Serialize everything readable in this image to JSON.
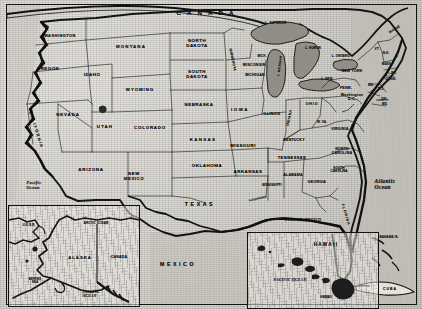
{
  "map": {
    "title": "United States of America political map with Alaska and Hawaii insets",
    "style": "vintage monochrome halftone scan",
    "colors": {
      "ink": "#121212",
      "paper": "#d8d6d0",
      "lake_fill": "#8d8a84",
      "ocean_texture": "#b9b6b0"
    },
    "countries": [
      {
        "name": "CANADA",
        "x": 208,
        "y": 13
      },
      {
        "name": "MEXICO",
        "x": 178,
        "y": 265
      },
      {
        "name": "CUBA",
        "x": 390,
        "y": 290
      }
    ],
    "states": [
      {
        "name": "WASHINGTON",
        "x": 60,
        "y": 36
      },
      {
        "name": "OREGON",
        "x": 48,
        "y": 69
      },
      {
        "name": "IDAHO",
        "x": 92,
        "y": 75
      },
      {
        "name": "MONTANA",
        "x": 131,
        "y": 47
      },
      {
        "name": "WYOMING",
        "x": 140,
        "y": 90
      },
      {
        "name": "NEVADA",
        "x": 68,
        "y": 115
      },
      {
        "name": "UTAH",
        "x": 105,
        "y": 127
      },
      {
        "name": "CALIFORNIA",
        "x": 36,
        "y": 130
      },
      {
        "name": "ARIZONA",
        "x": 91,
        "y": 170
      },
      {
        "name": "NEW\nMEXICO",
        "x": 134,
        "y": 177
      },
      {
        "name": "COLORADO",
        "x": 150,
        "y": 128
      },
      {
        "name": "NORTH\nDAKOTA",
        "x": 197,
        "y": 44
      },
      {
        "name": "SOUTH\nDAKOTA",
        "x": 197,
        "y": 75
      },
      {
        "name": "NEBRASKA",
        "x": 199,
        "y": 105
      },
      {
        "name": "KANSAS",
        "x": 203,
        "y": 140
      },
      {
        "name": "OKLAHOMA",
        "x": 207,
        "y": 166
      },
      {
        "name": "TEXAS",
        "x": 200,
        "y": 205
      },
      {
        "name": "MINNESOTA",
        "x": 232,
        "y": 60
      },
      {
        "name": "IOWA",
        "x": 240,
        "y": 110
      },
      {
        "name": "MISSOURI",
        "x": 243,
        "y": 146
      },
      {
        "name": "ARKANSAS",
        "x": 248,
        "y": 172
      },
      {
        "name": "LOUISIANA",
        "x": 258,
        "y": 199
      },
      {
        "name": "WISCONSIN",
        "x": 254,
        "y": 66
      },
      {
        "name": "MICH.",
        "x": 262,
        "y": 56
      },
      {
        "name": "MICHIGAN",
        "x": 255,
        "y": 76
      },
      {
        "name": "ILLINOIS",
        "x": 272,
        "y": 115
      },
      {
        "name": "INDIANA",
        "x": 290,
        "y": 118
      },
      {
        "name": "OHIO",
        "x": 312,
        "y": 105
      },
      {
        "name": "KENTUCKY",
        "x": 294,
        "y": 141
      },
      {
        "name": "TENNESSEE",
        "x": 292,
        "y": 158
      },
      {
        "name": "MISSISSIPPI",
        "x": 272,
        "y": 185
      },
      {
        "name": "ALABAMA",
        "x": 293,
        "y": 176
      },
      {
        "name": "GEORGIA",
        "x": 317,
        "y": 183
      },
      {
        "name": "FLORIDA",
        "x": 345,
        "y": 215
      },
      {
        "name": "W. VA.",
        "x": 322,
        "y": 122
      },
      {
        "name": "VIRGINIA",
        "x": 340,
        "y": 130
      },
      {
        "name": "NORTH\nCAROLINA",
        "x": 342,
        "y": 152
      },
      {
        "name": "SOUTH\nCAROLINA",
        "x": 339,
        "y": 170
      },
      {
        "name": "PENN.",
        "x": 346,
        "y": 89
      },
      {
        "name": "NEW YORK",
        "x": 352,
        "y": 72
      },
      {
        "name": "MAINE",
        "x": 395,
        "y": 30
      },
      {
        "name": "VT.",
        "x": 377,
        "y": 49
      },
      {
        "name": "N.H.",
        "x": 386,
        "y": 53
      },
      {
        "name": "MASS.",
        "x": 387,
        "y": 64
      },
      {
        "name": "R.I.",
        "x": 394,
        "y": 73
      },
      {
        "name": "CONN.",
        "x": 391,
        "y": 79
      },
      {
        "name": "N.J.",
        "x": 381,
        "y": 89
      },
      {
        "name": "MD.",
        "x": 371,
        "y": 85
      },
      {
        "name": "DEL.",
        "x": 385,
        "y": 99
      },
      {
        "name": "MD.",
        "x": 385,
        "y": 104
      }
    ],
    "cities": [
      {
        "name": "Washington\nD.C.",
        "x": 352,
        "y": 98
      }
    ],
    "lakes": [
      {
        "name": "L. SUPERIOR",
        "x": 276,
        "y": 23
      },
      {
        "name": "L. HURON",
        "x": 313,
        "y": 48
      },
      {
        "name": "L. ONTARIO",
        "x": 341,
        "y": 56
      },
      {
        "name": "L. ERIE",
        "x": 327,
        "y": 79
      },
      {
        "name": "L. MICHIGAN",
        "x": 280,
        "y": 66
      }
    ],
    "waters": [
      {
        "name": "Pacific\nOcean",
        "x": 34,
        "y": 186,
        "size": "o3"
      },
      {
        "name": "Atlantic\nOcean",
        "x": 385,
        "y": 184,
        "size": "o2"
      },
      {
        "name": "GULF OF MEXICO",
        "x": 303,
        "y": 221,
        "size": "o4"
      }
    ],
    "islands": [
      {
        "name": "BAHAMA IS.",
        "x": 389,
        "y": 237
      }
    ]
  },
  "inset_alaska": {
    "title": "ALASKA",
    "labels": [
      {
        "name": "U.S.S.R.",
        "x": 20,
        "y": 19
      },
      {
        "name": "ARCTIC OCEAN",
        "x": 87,
        "y": 17
      },
      {
        "name": "ALASKA",
        "x": 71,
        "y": 52
      },
      {
        "name": "CANADA",
        "x": 110,
        "y": 52
      },
      {
        "name": "BERING\nSEA",
        "x": 26,
        "y": 75
      },
      {
        "name": "PACIFIC\nOCEAN",
        "x": 82,
        "y": 88
      }
    ]
  },
  "inset_hawaii": {
    "title": "HAWAII",
    "labels": [
      {
        "name": "PACIFIC OCEAN",
        "x": 42,
        "y": 48
      },
      {
        "name": "HAWAII",
        "x": 78,
        "y": 64
      }
    ]
  }
}
